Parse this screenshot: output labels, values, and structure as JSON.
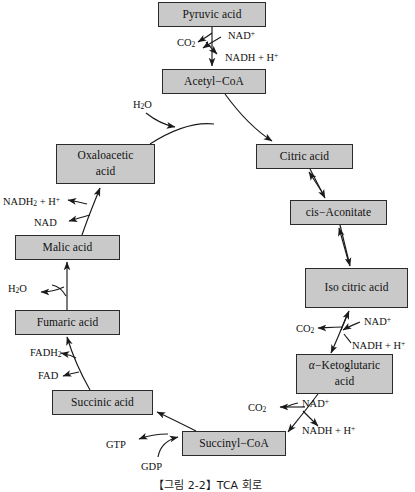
{
  "figure": {
    "caption": "【그림 2-2】TCA 회로",
    "box_fill_color": "#c9c9c9",
    "box_border_color": "#2b2b2b",
    "background_color": "#ffffff",
    "arrow_color": "#1a1a1a"
  },
  "nodes": [
    {
      "id": "pyruvic",
      "label": "Pyruvic acid",
      "x": 158,
      "y": 2,
      "w": 108,
      "h": 25,
      "lines": 1
    },
    {
      "id": "acetyl",
      "label": "Acetyl−CoA",
      "x": 162,
      "y": 69,
      "w": 104,
      "h": 25,
      "lines": 1
    },
    {
      "id": "citric",
      "label": "Citric acid",
      "x": 256,
      "y": 144,
      "w": 97,
      "h": 25,
      "lines": 1
    },
    {
      "id": "aconitate",
      "label": "cis−Aconitate",
      "x": 290,
      "y": 200,
      "w": 97,
      "h": 25,
      "lines": 1
    },
    {
      "id": "isocitric",
      "label": "Iso citric acid",
      "x": 305,
      "y": 268,
      "w": 103,
      "h": 40,
      "lines": 1
    },
    {
      "id": "ketoglutaric",
      "label": "α−Ketoglutaric acid",
      "x": 296,
      "y": 354,
      "w": 97,
      "h": 40,
      "lines": 2,
      "line1": "α−Ketoglutaric",
      "line2": "acid",
      "italic_first_char": true
    },
    {
      "id": "succinylcoa",
      "label": "Succinyl−CoA",
      "x": 182,
      "y": 431,
      "w": 104,
      "h": 25,
      "lines": 1
    },
    {
      "id": "succinic",
      "label": "Succinic acid",
      "x": 52,
      "y": 390,
      "w": 101,
      "h": 25,
      "lines": 1
    },
    {
      "id": "fumaric",
      "label": "Fumaric acid",
      "x": 15,
      "y": 310,
      "w": 105,
      "h": 25,
      "lines": 1
    },
    {
      "id": "malic",
      "label": "Malic acid",
      "x": 15,
      "y": 235,
      "w": 105,
      "h": 25,
      "lines": 1
    },
    {
      "id": "oxaloacetic",
      "label": "Oxaloacetic acid",
      "x": 56,
      "y": 144,
      "w": 99,
      "h": 40,
      "lines": 2,
      "line1": "Oxaloacetic",
      "line2": "acid"
    }
  ],
  "cofactors": [
    {
      "id": "co2-pyruvate",
      "text": "CO2",
      "sub": "2",
      "sup": "",
      "x": 177,
      "y": 38
    },
    {
      "id": "nad-pyruvate",
      "text": "NAD+",
      "sub": "",
      "sup": "+",
      "x": 225,
      "y": 30
    },
    {
      "id": "nadhh-pyruvate",
      "text": "NADH + H+",
      "sub": "",
      "sup": "+",
      "x": 225,
      "y": 52
    },
    {
      "id": "h2o-citrate",
      "text": "H2O",
      "sub": "2",
      "sup": "",
      "x": 133,
      "y": 100
    },
    {
      "id": "nadh2-malate",
      "text": "NADH2 + H+",
      "sub": "2",
      "sup": "+",
      "x": 3,
      "y": 196
    },
    {
      "id": "nad-malate",
      "text": "NAD",
      "sub": "",
      "sup": "",
      "x": 34,
      "y": 218
    },
    {
      "id": "h2o-fumarate",
      "text": "H2O",
      "sub": "2",
      "sup": "",
      "x": 8,
      "y": 283
    },
    {
      "id": "fadh2-succinate",
      "text": "FADH2",
      "sub": "2",
      "sup": "",
      "x": 30,
      "y": 348
    },
    {
      "id": "fad-succinate",
      "text": "FAD",
      "sub": "",
      "sup": "",
      "x": 38,
      "y": 371
    },
    {
      "id": "gtp-succinyl",
      "text": "GTP",
      "sub": "",
      "sup": "",
      "x": 106,
      "y": 440
    },
    {
      "id": "gdp-succinyl",
      "text": "GDP",
      "sub": "",
      "sup": "",
      "x": 141,
      "y": 462
    },
    {
      "id": "co2-isocitrate",
      "text": "CO2",
      "sub": "2",
      "sup": "",
      "x": 296,
      "y": 325
    },
    {
      "id": "nad-isocitrate",
      "text": "NAD+",
      "sub": "",
      "sup": "+",
      "x": 362,
      "y": 318
    },
    {
      "id": "nadhh-isocitrate",
      "text": "NADH + H+",
      "sub": "",
      "sup": "+",
      "x": 352,
      "y": 340
    },
    {
      "id": "co2-ketoglutarate",
      "text": "CO2",
      "sub": "2",
      "sup": "",
      "x": 248,
      "y": 404
    },
    {
      "id": "nad-ketoglutarate",
      "text": "NAD+",
      "sub": "",
      "sup": "+",
      "x": 300,
      "y": 399
    },
    {
      "id": "nadhh-ketoglut",
      "text": "NADH + H+",
      "sub": "",
      "sup": "+",
      "x": 302,
      "y": 425
    }
  ]
}
